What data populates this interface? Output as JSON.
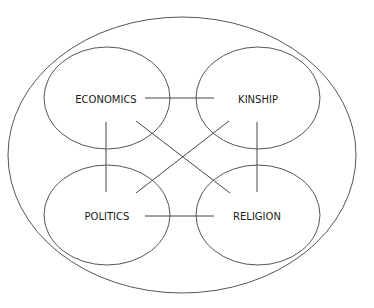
{
  "diagram": {
    "type": "nested-venn-network",
    "outer": {
      "cx": 182,
      "cy": 155,
      "rx": 174,
      "ry": 138
    },
    "nodes": [
      {
        "id": "economics",
        "label": "ECONOMICS",
        "cx": 107,
        "cy": 98,
        "rx": 63,
        "ry": 51,
        "tx": 106,
        "ty": 99
      },
      {
        "id": "kinship",
        "label": "KINSHIP",
        "cx": 258,
        "cy": 98,
        "rx": 62,
        "ry": 51,
        "tx": 258,
        "ty": 99
      },
      {
        "id": "politics",
        "label": "POLITICS",
        "cx": 107,
        "cy": 215,
        "rx": 63,
        "ry": 50,
        "tx": 107,
        "ty": 216
      },
      {
        "id": "religion",
        "label": "RELIGION",
        "cx": 258,
        "cy": 215,
        "rx": 62,
        "ry": 50,
        "tx": 257,
        "ty": 216
      }
    ],
    "edges": [
      {
        "from": "economics",
        "to": "kinship",
        "x1": 145,
        "y1": 98,
        "x2": 214,
        "y2": 98
      },
      {
        "from": "politics",
        "to": "religion",
        "x1": 145,
        "y1": 216,
        "x2": 214,
        "y2": 216
      },
      {
        "from": "economics",
        "to": "politics",
        "x1": 106,
        "y1": 122,
        "x2": 106,
        "y2": 192
      },
      {
        "from": "kinship",
        "to": "religion",
        "x1": 257,
        "y1": 122,
        "x2": 257,
        "y2": 192
      },
      {
        "from": "economics",
        "to": "religion",
        "x1": 136,
        "y1": 121,
        "x2": 230,
        "y2": 193
      },
      {
        "from": "kinship",
        "to": "politics",
        "x1": 229,
        "y1": 121,
        "x2": 136,
        "y2": 193
      }
    ]
  }
}
